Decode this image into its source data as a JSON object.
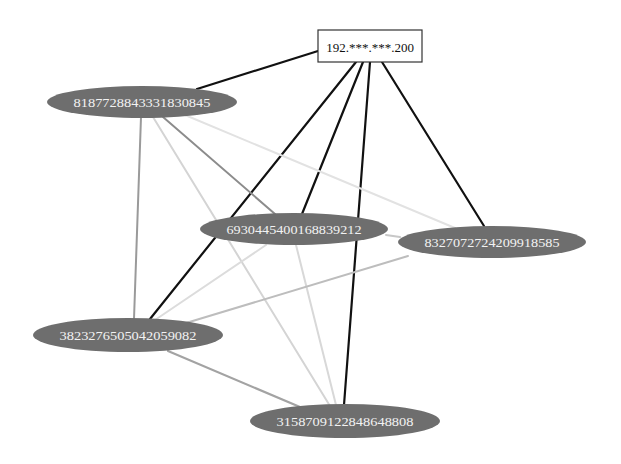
{
  "diagram": {
    "type": "network-graph",
    "root": {
      "id": "root",
      "label": "192.***.***.200",
      "shape": "box",
      "x": 370,
      "y": 46,
      "w": 104,
      "h": 32,
      "fill": "#ffffff",
      "stroke": "#333333"
    },
    "nodes": [
      {
        "id": "n818",
        "label": "8187728843331830845",
        "x": 142,
        "y": 102,
        "rx": 95,
        "ry": 16
      },
      {
        "id": "n693",
        "label": "6930445400168839212",
        "x": 294,
        "y": 229,
        "rx": 94,
        "ry": 16
      },
      {
        "id": "n832",
        "label": "8327072724209918585",
        "x": 492,
        "y": 242,
        "rx": 94,
        "ry": 16
      },
      {
        "id": "n382",
        "label": "3823276505042059082",
        "x": 128,
        "y": 335,
        "rx": 95,
        "ry": 17
      },
      {
        "id": "n315",
        "label": "3158709122848648808",
        "x": 345,
        "y": 421,
        "rx": 95,
        "ry": 17
      }
    ],
    "node_style": {
      "fill": "#6e6e6e",
      "text_color": "#f2f2f2"
    },
    "edges": [
      {
        "from": "root",
        "to": "n818",
        "x1": 318,
        "y1": 51,
        "x2": 197,
        "y2": 89,
        "color": "#111111",
        "width": 2.2
      },
      {
        "from": "root",
        "to": "n382",
        "x1": 356,
        "y1": 62,
        "x2": 150,
        "y2": 319,
        "color": "#111111",
        "width": 2.2
      },
      {
        "from": "root",
        "to": "n693",
        "x1": 363,
        "y1": 62,
        "x2": 302,
        "y2": 214,
        "color": "#111111",
        "width": 2.2
      },
      {
        "from": "root",
        "to": "n315",
        "x1": 370,
        "y1": 62,
        "x2": 344,
        "y2": 405,
        "color": "#111111",
        "width": 2.2
      },
      {
        "from": "root",
        "to": "n832",
        "x1": 382,
        "y1": 62,
        "x2": 484,
        "y2": 226,
        "color": "#111111",
        "width": 2.2
      },
      {
        "from": "n818",
        "to": "n382",
        "x1": 141,
        "y1": 117,
        "x2": 134,
        "y2": 319,
        "color": "#9a9a9a",
        "width": 2
      },
      {
        "from": "n818",
        "to": "n315",
        "x1": 153,
        "y1": 117,
        "x2": 330,
        "y2": 406,
        "color": "#d4d4d4",
        "width": 2
      },
      {
        "from": "n818",
        "to": "n693",
        "x1": 163,
        "y1": 117,
        "x2": 275,
        "y2": 214,
        "color": "#8c8c8c",
        "width": 2
      },
      {
        "from": "n818",
        "to": "n832",
        "x1": 185,
        "y1": 115,
        "x2": 455,
        "y2": 228,
        "color": "#e2e2e2",
        "width": 2
      },
      {
        "from": "n693",
        "to": "n832",
        "x1": 386,
        "y1": 235,
        "x2": 400,
        "y2": 237,
        "color": "#c8c8c8",
        "width": 2
      },
      {
        "from": "n693",
        "to": "n382",
        "x1": 266,
        "y1": 245,
        "x2": 155,
        "y2": 320,
        "color": "#dcdcdc",
        "width": 2
      },
      {
        "from": "n693",
        "to": "n315",
        "x1": 296,
        "y1": 245,
        "x2": 336,
        "y2": 405,
        "color": "#d8d8d8",
        "width": 2
      },
      {
        "from": "n832",
        "to": "n382",
        "x1": 408,
        "y1": 256,
        "x2": 186,
        "y2": 323,
        "color": "#bdbdbd",
        "width": 2
      },
      {
        "from": "n382",
        "to": "n315",
        "x1": 168,
        "y1": 351,
        "x2": 300,
        "y2": 407,
        "color": "#a3a3a3",
        "width": 2.2
      }
    ]
  }
}
